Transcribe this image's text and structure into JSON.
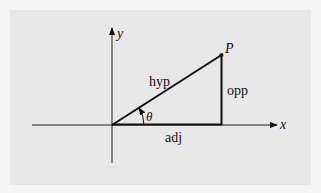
{
  "diagram": {
    "type": "right-triangle-trigonometry",
    "axes": {
      "x_label": "x",
      "y_label": "y"
    },
    "point": {
      "label": "P"
    },
    "sides": {
      "hypotenuse": "hyp",
      "opposite": "opp",
      "adjacent": "adj"
    },
    "angle": {
      "label": "θ"
    },
    "colors": {
      "line": "#111111",
      "background": "#e8e8e8"
    }
  }
}
